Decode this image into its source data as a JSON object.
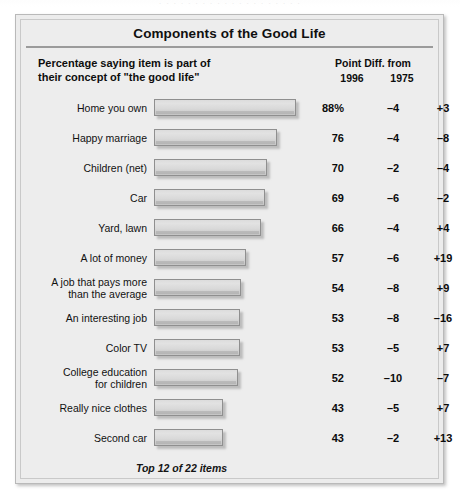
{
  "scan": {
    "top_sliver_text": "· · · · · · · · · · · · · · · · · · · ·"
  },
  "panel": {
    "title": "Components of the Good Life",
    "header": {
      "left_line1": "Percentage saying item is part of",
      "left_line2": "their concept of \"the good life\"",
      "right_title": "Point Diff. from",
      "col_1996": "1996",
      "col_1975": "1975"
    },
    "footnote": "Top 12 of 22 items"
  },
  "chart_data": {
    "type": "bar",
    "title": "Components of the Good Life",
    "subtitle": "Percentage saying item is part of their concept of \"the good life\"",
    "orientation": "horizontal",
    "xlabel": "",
    "ylabel": "",
    "xlim": [
      0,
      88
    ],
    "grid": false,
    "legend": false,
    "note": "Top 12 of 22 items",
    "value_suffix_first_row": "%",
    "extra_columns": [
      "Point Diff. from 1996",
      "Point Diff. from 1975"
    ],
    "categories": [
      "Home you own",
      "Happy marriage",
      "Children (net)",
      "Car",
      "Yard, lawn",
      "A lot of money",
      "A job that pays more than the average",
      "An interesting job",
      "Color TV",
      "College education for children",
      "Really nice clothes",
      "Second car"
    ],
    "values": [
      88,
      76,
      70,
      69,
      66,
      57,
      54,
      53,
      53,
      52,
      43,
      43
    ],
    "value_labels": [
      "88%",
      "76",
      "70",
      "69",
      "66",
      "57",
      "54",
      "53",
      "53",
      "52",
      "43",
      "43"
    ],
    "diff_1996": [
      -4,
      -4,
      -2,
      -6,
      -4,
      -6,
      -8,
      -8,
      -5,
      -10,
      -5,
      -2
    ],
    "diff_1975": [
      3,
      -8,
      -4,
      -2,
      4,
      19,
      9,
      -16,
      7,
      -7,
      7,
      13
    ],
    "diff_1996_labels": [
      "–4",
      "–4",
      "–2",
      "–6",
      "–4",
      "–6",
      "–8",
      "–8",
      "–5",
      "–10",
      "–5",
      "–2"
    ],
    "diff_1975_labels": [
      "+3",
      "–8",
      "–4",
      "–2",
      "+4",
      "+19",
      "+9",
      "–16",
      "+7",
      "–7",
      "+7",
      "+13"
    ],
    "row_label_lines": [
      [
        "Home you own"
      ],
      [
        "Happy marriage"
      ],
      [
        "Children (net)"
      ],
      [
        "Car"
      ],
      [
        "Yard, lawn"
      ],
      [
        "A lot of money"
      ],
      [
        "A job that pays more",
        "than the average"
      ],
      [
        "An interesting job"
      ],
      [
        "Color TV"
      ],
      [
        "College education",
        "for children"
      ],
      [
        "Really nice clothes"
      ],
      [
        "Second car"
      ]
    ]
  },
  "colors": {
    "panel_background": "#ececec",
    "panel_border": "#b9b9b9",
    "bar_fill": "#dcdcdc",
    "bar_border": "#8f8f8f",
    "text": "#111111",
    "rule": "#9b9b9b"
  }
}
